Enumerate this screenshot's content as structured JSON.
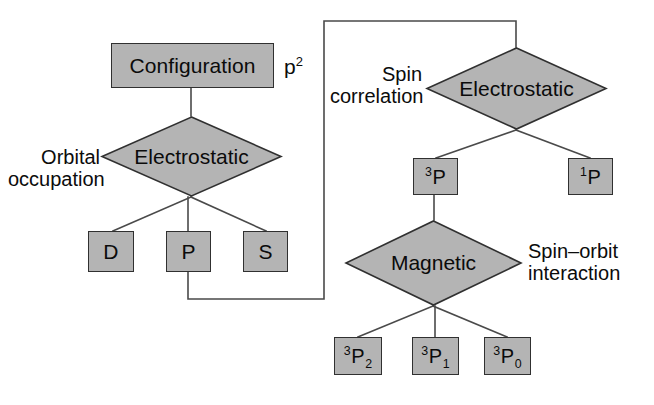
{
  "diagram": {
    "colors": {
      "node_fill": "#b4b4b4",
      "node_stroke": "#303030",
      "line": "#4a4a4a",
      "text": "#0b0b0b",
      "background": "#ffffff"
    },
    "nodes": {
      "configuration": {
        "label": "Configuration"
      },
      "configuration_superscript": {
        "base": "p",
        "exponent": "2"
      },
      "electrostatic_left": {
        "label": "Electrostatic"
      },
      "electrostatic_right": {
        "label": "Electrostatic"
      },
      "magnetic": {
        "label": "Magnetic"
      },
      "term_d": {
        "label": "D"
      },
      "term_p": {
        "label": "P"
      },
      "term_s": {
        "label": "S"
      },
      "term_3p": {
        "pre": "3",
        "base": "P",
        "post": ""
      },
      "term_1p": {
        "pre": "1",
        "base": "P",
        "post": ""
      },
      "term_3p2": {
        "pre": "3",
        "base": "P",
        "post": "2"
      },
      "term_3p1": {
        "pre": "3",
        "base": "P",
        "post": "1"
      },
      "term_3p0": {
        "pre": "3",
        "base": "P",
        "post": "0"
      }
    },
    "annotations": {
      "orbital_occupation": "Orbital\noccupation",
      "spin_correlation": "Spin\ncorrelation",
      "spin_orbit_interaction": "Spin–orbit\ninteraction"
    }
  }
}
